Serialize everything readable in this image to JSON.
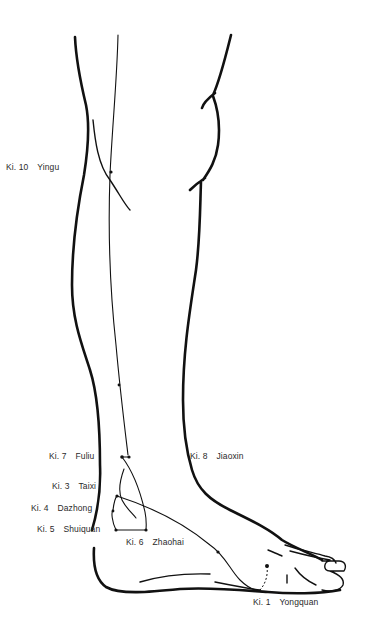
{
  "figure": {
    "points": [
      {
        "code": "Ki. 10",
        "name": "Yingu"
      },
      {
        "code": "Ki. 7",
        "name": "Fuliu"
      },
      {
        "code": "Ki. 8",
        "name": "Jiaoxin"
      },
      {
        "code": "Ki. 3",
        "name": "Taixi"
      },
      {
        "code": "Ki. 4",
        "name": "Dazhong"
      },
      {
        "code": "Ki. 5",
        "name": "Shuiquan"
      },
      {
        "code": "Ki. 6",
        "name": "Zhaohai"
      },
      {
        "code": "Ki. 1",
        "name": "Yongquan"
      }
    ]
  }
}
